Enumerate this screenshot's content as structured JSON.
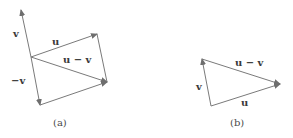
{
  "colors": {
    "stroke": "#7a7a7a",
    "text": "#3a3a3a"
  },
  "panel_a": {
    "caption": "(a)",
    "labels": {
      "v": "v",
      "u": "u",
      "u_minus_v": "u − v",
      "neg_v": "−v"
    }
  },
  "panel_b": {
    "caption": "(b)",
    "labels": {
      "v": "v",
      "u": "u",
      "u_minus_v": "u − v"
    }
  }
}
